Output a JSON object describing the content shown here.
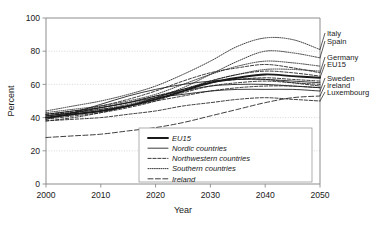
{
  "chart_data": {
    "type": "line",
    "title": "",
    "xlabel": "Year",
    "ylabel": "Percent",
    "xlim": [
      2000,
      2050
    ],
    "ylim": [
      0,
      100
    ],
    "xticks": [
      2000,
      2010,
      2020,
      2030,
      2040,
      2050
    ],
    "yticks": [
      0,
      20,
      40,
      60,
      80,
      100
    ],
    "grid": "horizontal-dotted",
    "legend_position": "bottom-center",
    "legend": [
      {
        "label": "EU15",
        "style": "thick-solid"
      },
      {
        "label": "Nordic countries",
        "style": "thin-solid"
      },
      {
        "label": "Northwestern countries",
        "style": "dashed"
      },
      {
        "label": "Southern countries",
        "style": "dotted"
      },
      {
        "label": "Ireland",
        "style": "long-dashed"
      }
    ],
    "annotations": [
      {
        "text": "Italy",
        "value_at_2050": 81
      },
      {
        "text": "Spain",
        "value_at_2050": 76
      },
      {
        "text": "Germany",
        "value_at_2050": 67
      },
      {
        "text": "EU15",
        "value_at_2050": 64
      },
      {
        "text": "Sweden",
        "value_at_2050": 56
      },
      {
        "text": "Ireland",
        "value_at_2050": 53
      },
      {
        "text": "Luxembourg",
        "value_at_2050": 50
      }
    ],
    "x": [
      2000,
      2005,
      2010,
      2015,
      2020,
      2025,
      2030,
      2035,
      2040,
      2045,
      2050
    ],
    "series": [
      {
        "name": "Italy",
        "group": "Southern countries",
        "style": "dotted",
        "values": [
          44,
          47,
          50,
          54,
          59,
          66,
          74,
          83,
          88,
          87,
          81
        ]
      },
      {
        "name": "Spain",
        "group": "Southern countries",
        "style": "dotted",
        "values": [
          40,
          42,
          44,
          47,
          52,
          58,
          66,
          74,
          80,
          79,
          76
        ]
      },
      {
        "name": "Greece",
        "group": "Southern countries",
        "style": "dotted",
        "values": [
          43,
          45,
          47,
          50,
          54,
          60,
          66,
          71,
          74,
          73,
          71
        ]
      },
      {
        "name": "Portugal",
        "group": "Southern countries",
        "style": "dotted",
        "values": [
          41,
          43,
          45,
          48,
          52,
          57,
          62,
          66,
          69,
          69,
          68
        ]
      },
      {
        "name": "Germany",
        "group": "Northwestern countries",
        "style": "dashed",
        "values": [
          42,
          44,
          47,
          51,
          56,
          62,
          67,
          70,
          72,
          70,
          67
        ]
      },
      {
        "name": "EU15",
        "group": "EU15",
        "style": "thick-solid",
        "values": [
          40,
          42,
          44,
          47,
          51,
          56,
          61,
          64,
          66,
          65,
          64
        ]
      },
      {
        "name": "Austria",
        "group": "Northwestern countries",
        "style": "dashed",
        "values": [
          39,
          41,
          43,
          46,
          50,
          56,
          62,
          66,
          68,
          67,
          65
        ]
      },
      {
        "name": "France",
        "group": "Northwestern countries",
        "style": "dashed",
        "values": [
          41,
          43,
          46,
          49,
          53,
          57,
          61,
          63,
          64,
          63,
          62
        ]
      },
      {
        "name": "Belgium",
        "group": "Northwestern countries",
        "style": "dashed",
        "values": [
          40,
          42,
          44,
          47,
          51,
          55,
          59,
          61,
          62,
          61,
          60
        ]
      },
      {
        "name": "Netherlands",
        "group": "Northwestern countries",
        "style": "dashed",
        "values": [
          38,
          40,
          43,
          47,
          52,
          57,
          61,
          63,
          63,
          61,
          59
        ]
      },
      {
        "name": "United Kingdom",
        "group": "Northwestern countries",
        "style": "dashed",
        "values": [
          42,
          43,
          45,
          47,
          50,
          53,
          56,
          58,
          59,
          59,
          58
        ]
      },
      {
        "name": "Denmark",
        "group": "Nordic countries",
        "style": "thin-solid",
        "values": [
          41,
          43,
          46,
          49,
          53,
          56,
          59,
          60,
          60,
          59,
          58
        ]
      },
      {
        "name": "Finland",
        "group": "Nordic countries",
        "style": "thin-solid",
        "values": [
          39,
          43,
          48,
          53,
          57,
          60,
          62,
          63,
          63,
          62,
          61
        ]
      },
      {
        "name": "Sweden",
        "group": "Nordic countries",
        "style": "thin-solid",
        "values": [
          42,
          44,
          46,
          49,
          52,
          54,
          56,
          57,
          57,
          57,
          56
        ]
      },
      {
        "name": "Luxembourg",
        "group": "Northwestern countries",
        "style": "dashed",
        "values": [
          38,
          39,
          40,
          42,
          44,
          47,
          49,
          51,
          52,
          51,
          50
        ]
      },
      {
        "name": "Ireland",
        "group": "Ireland",
        "style": "long-dashed",
        "values": [
          28,
          29,
          30,
          32,
          34,
          37,
          41,
          45,
          49,
          52,
          53
        ]
      }
    ]
  }
}
